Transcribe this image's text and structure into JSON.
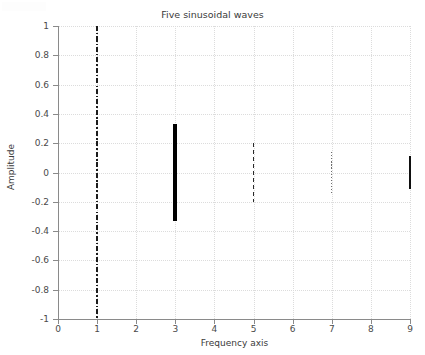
{
  "chart_data": {
    "type": "bar",
    "title": "Five sinusoidal waves",
    "xlabel": "Frequency axis",
    "ylabel": "Amplitude",
    "xlim": [
      0,
      9
    ],
    "ylim": [
      -1,
      1
    ],
    "grid": true,
    "legend": "none",
    "xticks": [
      "0",
      "1",
      "2",
      "3",
      "4",
      "5",
      "6",
      "7",
      "8",
      "9"
    ],
    "xtick_values": [
      0,
      1,
      2,
      3,
      4,
      5,
      6,
      7,
      8,
      9
    ],
    "yticks": [
      "1",
      "0.8",
      "0.6",
      "0.4",
      "0.2",
      "0",
      "-0.2",
      "-0.4",
      "-0.6",
      "-0.8",
      "-1"
    ],
    "ytick_values": [
      1,
      0.8,
      0.6,
      0.4,
      0.2,
      0,
      -0.2,
      -0.4,
      -0.6,
      -0.8,
      -1
    ],
    "x": [
      1,
      3,
      5,
      7,
      9
    ],
    "values": [
      1,
      0.33,
      0.2,
      0.14,
      0.11
    ],
    "series": [
      {
        "name": "harmonic-1",
        "x": 1,
        "amplitude": 1,
        "y_min": -1,
        "y_max": 1,
        "linestyle": "dashdot",
        "linewidth": 2.6,
        "color": "#1c1c1c"
      },
      {
        "name": "harmonic-3",
        "x": 3,
        "amplitude": 0.33,
        "y_min": -0.33,
        "y_max": 0.33,
        "linestyle": "solid",
        "linewidth": 4.0,
        "color": "#000000"
      },
      {
        "name": "harmonic-5",
        "x": 5,
        "amplitude": 0.2,
        "y_min": -0.2,
        "y_max": 0.2,
        "linestyle": "dashed",
        "linewidth": 1.8,
        "color": "#2a2a2a"
      },
      {
        "name": "harmonic-7",
        "x": 7,
        "amplitude": 0.14,
        "y_min": -0.14,
        "y_max": 0.14,
        "linestyle": "dotted",
        "linewidth": 1.2,
        "color": "#6e6e6e"
      },
      {
        "name": "harmonic-9",
        "x": 9,
        "amplitude": 0.11,
        "y_min": -0.11,
        "y_max": 0.11,
        "linestyle": "solid",
        "linewidth": 1.4,
        "color": "#0f0f0f"
      }
    ]
  },
  "style": {
    "background": "#ffffff",
    "axis_color": "#8a8a8a",
    "grid_color": "#dcdcdc",
    "text_color": "#3a3a3a"
  }
}
